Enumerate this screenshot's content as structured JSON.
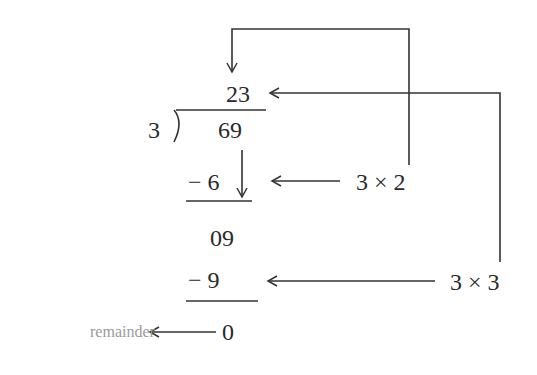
{
  "diagram": {
    "quotient": "23",
    "divisor": "3",
    "division_symbol": ")",
    "dividend": "69",
    "step1": {
      "subtract": "− 6",
      "product": "3 × 2"
    },
    "bring_down": "09",
    "step2": {
      "subtract": "− 9",
      "product": "3 × 3"
    },
    "remainder_value": "0",
    "remainder_label": "remainder",
    "colors": {
      "ink": "#2a2a2a",
      "label": "#9a9a9a"
    }
  }
}
